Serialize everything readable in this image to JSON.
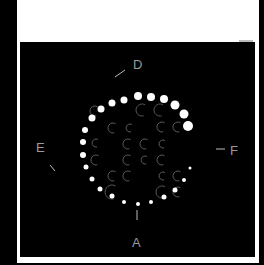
{
  "figure": {
    "background_color": "#000000",
    "panel_color": "#ffffff",
    "labels": {
      "top": "D",
      "left": "E",
      "right": "F",
      "bottom": "A"
    },
    "ring_dots": [
      {
        "x": 124,
        "y": 100,
        "r": 3.5
      },
      {
        "x": 138,
        "y": 96,
        "r": 4
      },
      {
        "x": 151,
        "y": 97,
        "r": 4
      },
      {
        "x": 164,
        "y": 99,
        "r": 4
      },
      {
        "x": 175,
        "y": 105,
        "r": 4.5
      },
      {
        "x": 184,
        "y": 114,
        "r": 4.5
      },
      {
        "x": 188,
        "y": 126,
        "r": 5
      },
      {
        "x": 112,
        "y": 103,
        "r": 3.5
      },
      {
        "x": 101,
        "y": 109,
        "r": 3.5
      },
      {
        "x": 92,
        "y": 118,
        "r": 3.5
      },
      {
        "x": 85,
        "y": 130,
        "r": 3
      },
      {
        "x": 83,
        "y": 142,
        "r": 3
      },
      {
        "x": 83,
        "y": 155,
        "r": 3
      },
      {
        "x": 86,
        "y": 167,
        "r": 2.5
      },
      {
        "x": 92,
        "y": 179,
        "r": 2.5
      },
      {
        "x": 100,
        "y": 189,
        "r": 2.5
      },
      {
        "x": 112,
        "y": 196,
        "r": 2.5
      },
      {
        "x": 124,
        "y": 202,
        "r": 2
      },
      {
        "x": 138,
        "y": 204,
        "r": 2
      },
      {
        "x": 151,
        "y": 202,
        "r": 2
      },
      {
        "x": 164,
        "y": 197,
        "r": 2.5
      },
      {
        "x": 175,
        "y": 190,
        "r": 2.5
      },
      {
        "x": 184,
        "y": 180,
        "r": 2
      },
      {
        "x": 190,
        "y": 168,
        "r": 1.5
      }
    ],
    "crescents": [
      {
        "x": 95,
        "y": 111,
        "r": 5
      },
      {
        "x": 142,
        "y": 110,
        "r": 6
      },
      {
        "x": 160,
        "y": 110,
        "r": 6
      },
      {
        "x": 113,
        "y": 128,
        "r": 5
      },
      {
        "x": 130,
        "y": 128,
        "r": 4
      },
      {
        "x": 162,
        "y": 127,
        "r": 5
      },
      {
        "x": 178,
        "y": 127,
        "r": 5
      },
      {
        "x": 96,
        "y": 143,
        "r": 4
      },
      {
        "x": 128,
        "y": 144,
        "r": 5
      },
      {
        "x": 145,
        "y": 144,
        "r": 5
      },
      {
        "x": 163,
        "y": 144,
        "r": 4
      },
      {
        "x": 96,
        "y": 160,
        "r": 5
      },
      {
        "x": 128,
        "y": 160,
        "r": 5
      },
      {
        "x": 145,
        "y": 160,
        "r": 4
      },
      {
        "x": 162,
        "y": 160,
        "r": 5
      },
      {
        "x": 113,
        "y": 176,
        "r": 5
      },
      {
        "x": 128,
        "y": 176,
        "r": 5
      },
      {
        "x": 163,
        "y": 176,
        "r": 4
      },
      {
        "x": 178,
        "y": 176,
        "r": 5
      },
      {
        "x": 112,
        "y": 192,
        "r": 7
      },
      {
        "x": 162,
        "y": 192,
        "r": 6
      },
      {
        "x": 178,
        "y": 192,
        "r": 5
      }
    ]
  }
}
